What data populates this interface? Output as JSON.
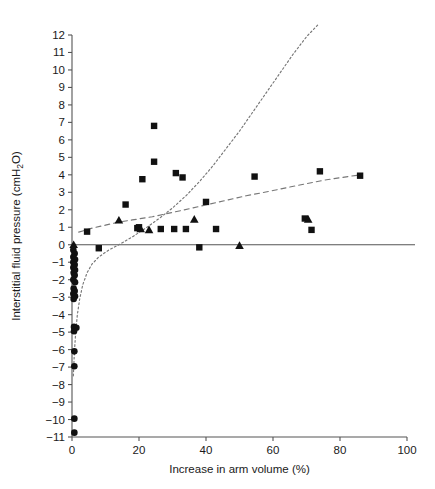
{
  "chart_data": {
    "type": "scatter",
    "title": "",
    "xlabel": "Increase in arm volume (%)",
    "ylabel": "Interstitial fluid pressure (cmH2O)",
    "ylabel_main": "Interstitial fluid pressure (cmH",
    "ylabel_sub": "2",
    "ylabel_tail": "O)",
    "xlim": [
      0,
      100
    ],
    "ylim": [
      -11,
      12
    ],
    "grid": false,
    "legend": "none",
    "xticks": [
      0,
      20,
      40,
      60,
      80,
      100
    ],
    "xtick_labels": [
      "0",
      "20",
      "40",
      "60",
      "80",
      "100"
    ],
    "yticks": [
      12,
      11,
      10,
      9,
      8,
      7,
      6,
      5,
      4,
      3,
      2,
      1,
      0,
      -1,
      -2,
      -3,
      -4,
      -5,
      -6,
      -7,
      -8,
      -9,
      -10,
      -11
    ],
    "ytick_labels": [
      "12",
      "11",
      "10",
      "9",
      "8",
      "7",
      "6",
      "5",
      "4",
      "3",
      "2",
      "1",
      "0",
      "−1",
      "−2",
      "−3",
      "−4",
      "−5",
      "−6",
      "−7",
      "−8",
      "−9",
      "−10",
      "−11"
    ],
    "zero_reference_line": 0,
    "marker_color": "#111111",
    "fit_color": "#777777",
    "axis_color": "#555555",
    "series": [
      {
        "name": "squares",
        "marker": "square",
        "points": [
          [
            4.5,
            0.75
          ],
          [
            8.0,
            -0.2
          ],
          [
            16.0,
            2.3
          ],
          [
            19.5,
            0.95
          ],
          [
            20.0,
            1.0
          ],
          [
            21.0,
            3.75
          ],
          [
            24.5,
            6.8
          ],
          [
            24.5,
            4.75
          ],
          [
            26.5,
            0.9
          ],
          [
            30.5,
            0.9
          ],
          [
            31.0,
            4.1
          ],
          [
            33.0,
            3.85
          ],
          [
            34.0,
            0.9
          ],
          [
            38.0,
            -0.15
          ],
          [
            40.0,
            2.45
          ],
          [
            43.0,
            0.9
          ],
          [
            54.5,
            3.9
          ],
          [
            69.5,
            1.5
          ],
          [
            71.5,
            0.85
          ],
          [
            74.0,
            4.2
          ],
          [
            86.0,
            3.95
          ]
        ]
      },
      {
        "name": "triangles",
        "marker": "triangle",
        "points": [
          [
            0.5,
            0.0
          ],
          [
            14.0,
            1.4
          ],
          [
            20.5,
            0.9
          ],
          [
            23.0,
            0.85
          ],
          [
            36.5,
            1.45
          ],
          [
            50.0,
            -0.05
          ],
          [
            70.5,
            1.45
          ]
        ]
      },
      {
        "name": "circles",
        "marker": "circle",
        "points": [
          [
            0.4,
            -0.3
          ],
          [
            0.8,
            -0.5
          ],
          [
            0.4,
            -0.7
          ],
          [
            0.9,
            -0.85
          ],
          [
            0.4,
            -1.0
          ],
          [
            0.8,
            -1.15
          ],
          [
            0.4,
            -1.3
          ],
          [
            0.9,
            -1.45
          ],
          [
            0.5,
            -1.6
          ],
          [
            0.8,
            -1.75
          ],
          [
            0.4,
            -2.0
          ],
          [
            0.9,
            -2.15
          ],
          [
            0.5,
            -2.5
          ],
          [
            0.8,
            -2.65
          ],
          [
            0.4,
            -2.8
          ],
          [
            0.9,
            -2.95
          ],
          [
            0.5,
            -3.1
          ],
          [
            0.6,
            -4.7
          ],
          [
            1.3,
            -4.75
          ],
          [
            0.6,
            -4.95
          ],
          [
            0.7,
            -6.1
          ],
          [
            0.7,
            -6.95
          ],
          [
            0.7,
            -9.95
          ],
          [
            0.7,
            -10.75
          ]
        ]
      }
    ],
    "fit_curves": [
      {
        "name": "upper-dashed-fit",
        "style": "dashed",
        "description": "Shallow rising dashed regression line",
        "points": [
          [
            2.0,
            0.72
          ],
          [
            6.0,
            0.95
          ],
          [
            10.0,
            1.12
          ],
          [
            14.0,
            1.3
          ],
          [
            18.0,
            1.42
          ],
          [
            24.0,
            1.6
          ],
          [
            30.0,
            1.85
          ],
          [
            36.0,
            2.1
          ],
          [
            44.0,
            2.45
          ],
          [
            52.0,
            2.8
          ],
          [
            60.0,
            3.1
          ],
          [
            68.0,
            3.42
          ],
          [
            76.0,
            3.72
          ],
          [
            86.0,
            4.0
          ]
        ]
      },
      {
        "name": "lower-dotted-fit",
        "style": "dotted",
        "description": "Steep exponential dotted curve rising from lower-left to top-right",
        "points": [
          [
            0.4,
            -7.5
          ],
          [
            0.7,
            -6.2
          ],
          [
            1.1,
            -5.0
          ],
          [
            1.6,
            -4.0
          ],
          [
            2.3,
            -3.1
          ],
          [
            3.2,
            -2.3
          ],
          [
            4.5,
            -1.6
          ],
          [
            6.0,
            -1.1
          ],
          [
            8.0,
            -0.7
          ],
          [
            11.0,
            -0.3
          ],
          [
            14.0,
            0.0
          ],
          [
            18.0,
            0.45
          ],
          [
            22.0,
            0.95
          ],
          [
            26.0,
            1.5
          ],
          [
            30.0,
            2.1
          ],
          [
            34.0,
            2.8
          ],
          [
            38.0,
            3.6
          ],
          [
            42.0,
            4.5
          ],
          [
            46.0,
            5.5
          ],
          [
            50.0,
            6.5
          ],
          [
            54.0,
            7.6
          ],
          [
            58.0,
            8.7
          ],
          [
            62.0,
            9.8
          ],
          [
            66.0,
            10.9
          ],
          [
            70.0,
            11.9
          ],
          [
            73.5,
            12.6
          ]
        ]
      }
    ]
  }
}
